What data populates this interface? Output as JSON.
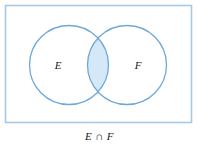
{
  "figure": {
    "caption": "E ∩ F",
    "universal_set": {
      "shape": "rectangle",
      "fill_color": "#ffffff",
      "border_color": "#a9c9e2"
    },
    "sets": [
      {
        "id": "E",
        "label": "E",
        "position": "left"
      },
      {
        "id": "F",
        "label": "F",
        "position": "right"
      }
    ],
    "region": {
      "name": "intersection",
      "symbol": "∩",
      "shaded": true,
      "shade_color": "#d4e8f7"
    },
    "colors": {
      "circle_stroke": "#6fa8d8",
      "shade_fill": "#d4e8f7",
      "rect_stroke": "#a9c9e2",
      "label_text": "#1a1a1a"
    }
  }
}
